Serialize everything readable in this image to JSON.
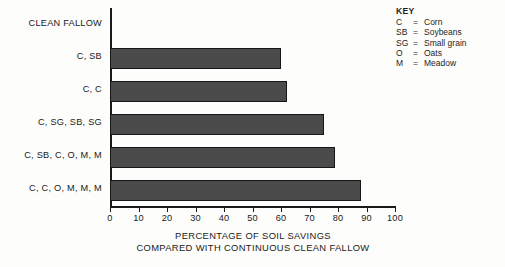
{
  "key": {
    "title": "KEY",
    "entries": [
      {
        "abbr": "C",
        "eq": "=",
        "meaning": "Corn"
      },
      {
        "abbr": "SB",
        "eq": "=",
        "meaning": "Soybeans"
      },
      {
        "abbr": "SG",
        "eq": "=",
        "meaning": "Small grain"
      },
      {
        "abbr": "O",
        "eq": "=",
        "meaning": "Oats"
      },
      {
        "abbr": "M",
        "eq": "=",
        "meaning": "Meadow"
      }
    ]
  },
  "axis_title": {
    "line1": "PERCENTAGE OF SOIL SAVINGS",
    "line2": "COMPARED WITH CONTINUOUS CLEAN FALLOW"
  },
  "colors": {
    "bar_fill": "#4b4b4b",
    "bar_stroke": "#161616",
    "axis": "#1a1a1a",
    "background": "#fdfdfb"
  },
  "chart_data": {
    "type": "bar",
    "orientation": "horizontal",
    "title": "",
    "xlabel": "PERCENTAGE OF SOIL SAVINGS COMPARED WITH CONTINUOUS CLEAN FALLOW",
    "ylabel": "",
    "xlim": [
      0,
      100
    ],
    "xticks": [
      0,
      10,
      20,
      30,
      40,
      50,
      60,
      70,
      80,
      90,
      100
    ],
    "xtick_labels": [
      "0",
      "10",
      "20",
      "30",
      "40",
      "50",
      "60",
      "70",
      "80",
      "90",
      "100"
    ],
    "grid": false,
    "legend": "none",
    "categories": [
      "CLEAN FALLOW",
      "C, SB",
      "C, C",
      "C, SG, SB, SG",
      "C, SB, C, O, M, M",
      "C, C, O, M, M, M"
    ],
    "values": [
      0,
      60,
      62,
      75,
      79,
      88
    ]
  }
}
